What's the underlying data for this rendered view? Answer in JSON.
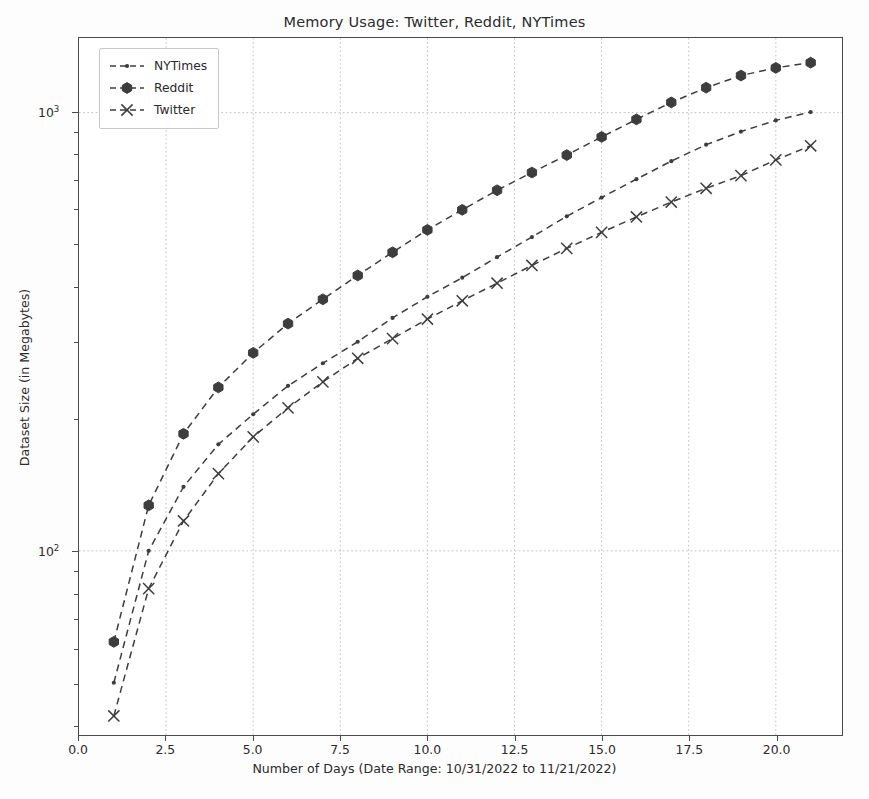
{
  "chart_data": {
    "type": "line",
    "title": "Memory Usage: Twitter, Reddit, NYTimes",
    "xlabel": "Number of Days (Date Range: 10/31/2022 to 11/21/2022)",
    "ylabel": "Dataset Size (in Megabytes)",
    "yscale": "log",
    "xscale": "linear",
    "xlim": [
      0.0,
      21.9
    ],
    "ylim": [
      38,
      1480
    ],
    "grid": true,
    "legend_position": "upper left",
    "x": [
      1,
      2,
      3,
      4,
      5,
      6,
      7,
      8,
      9,
      10,
      11,
      12,
      13,
      14,
      15,
      16,
      17,
      18,
      19,
      20,
      21
    ],
    "xticks": [
      "0.0",
      "2.5",
      "5.0",
      "7.5",
      "10.0",
      "12.5",
      "15.0",
      "17.5",
      "20.0"
    ],
    "xtick_values": [
      0.0,
      2.5,
      5.0,
      7.5,
      10.0,
      12.5,
      15.0,
      17.5,
      20.0
    ],
    "yticks": [
      "10²",
      "10³"
    ],
    "ytick_values": [
      100,
      1000
    ],
    "series": [
      {
        "name": "NYTimes",
        "marker": "point",
        "linestyle": "dashed",
        "color": "#3d3d3d",
        "values": [
          50,
          100,
          140,
          175,
          205,
          238,
          268,
          300,
          340,
          380,
          420,
          468,
          520,
          580,
          640,
          705,
          775,
          845,
          905,
          960,
          1003
        ]
      },
      {
        "name": "Reddit",
        "marker": "hexagon",
        "linestyle": "dashed",
        "color": "#3d3d3d",
        "values": [
          62,
          127,
          185,
          236,
          283,
          330,
          375,
          425,
          480,
          540,
          600,
          665,
          730,
          800,
          880,
          965,
          1055,
          1140,
          1215,
          1265,
          1300
        ]
      },
      {
        "name": "Twitter",
        "marker": "x",
        "linestyle": "dashed",
        "color": "#3d3d3d",
        "values": [
          42,
          82,
          117,
          150,
          182,
          212,
          243,
          275,
          305,
          338,
          372,
          408,
          448,
          490,
          533,
          578,
          625,
          672,
          718,
          780,
          840
        ]
      }
    ]
  },
  "colors": {
    "axis": "#4a4a4a",
    "grid": "#b9b9b9",
    "text": "#2b2b2b",
    "background": "#ffffff",
    "line": "#3d3d3d"
  }
}
